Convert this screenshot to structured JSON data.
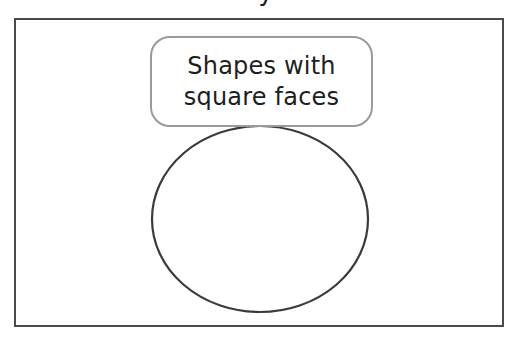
{
  "diagram": {
    "type": "venn-diagram",
    "top_fragment_text": "y",
    "frame": {
      "border_color": "#4a4a4a"
    },
    "label": {
      "lines": [
        "Shapes with",
        "square faces"
      ],
      "border_color": "#9a9a9a",
      "text_color": "#1e1e1e"
    },
    "circle": {
      "cx": 260,
      "cy": 219,
      "rx": 108,
      "ry": 93,
      "stroke": "#3a3a3a",
      "contents": []
    }
  }
}
